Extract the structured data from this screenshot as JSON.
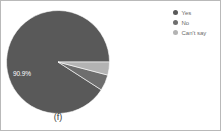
{
  "figure": {
    "caption": "(f)",
    "border_color": "#b9b9b9",
    "background": "#ffffff"
  },
  "legend": {
    "position": "top-right",
    "items": [
      {
        "label": "Yes",
        "color": "#595959",
        "swatch": "circle-swatch"
      },
      {
        "label": "No",
        "color": "#6e6e6e",
        "swatch": "circle-swatch"
      },
      {
        "label": "Can't say",
        "color": "#b3b3b3",
        "swatch": "circle-swatch"
      }
    ]
  },
  "labels": {
    "yes_percent": "90.9%"
  },
  "chart_data": {
    "type": "pie",
    "title": "",
    "categories": [
      "Yes",
      "No",
      "Can't say"
    ],
    "values": [
      90.9,
      5.0,
      4.1
    ],
    "value_labels": [
      "90.9%",
      "",
      ""
    ],
    "colors": [
      "#595959",
      "#6e6e6e",
      "#b3b3b3"
    ],
    "start_angle_deg": 0,
    "direction": "counterclockwise",
    "legend": true,
    "legend_position": "right",
    "grid": false,
    "caption": "(f)"
  }
}
